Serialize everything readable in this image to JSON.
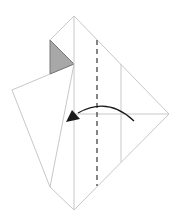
{
  "diagram": {
    "type": "origami-fold-step",
    "colors": {
      "background": "#ffffff",
      "paper_line": "#c8c8c8",
      "shaded_flap": "#a8a8a8",
      "shaded_outline": "#777777",
      "dashed_fold": "#444444",
      "arrow": "#1a1a1a"
    },
    "outer_diamond": {
      "top": [
        74,
        16
      ],
      "right": [
        169,
        114
      ],
      "bottom": [
        74,
        210
      ],
      "left_top_notch": [
        50,
        40
      ]
    },
    "center_vertical_crease": {
      "x": 74,
      "y1": 16,
      "y2": 210
    },
    "horizontal_crease": {
      "y": 114,
      "x1": 74,
      "x2": 169
    },
    "right_vertical_crease": {
      "x": 121,
      "y1": 64,
      "y2": 162
    },
    "valley_fold_dashed": {
      "x": 97,
      "y1": 40,
      "y2": 186
    },
    "shaded_triangle": [
      [
        50,
        40
      ],
      [
        74,
        64
      ],
      [
        50,
        74
      ]
    ],
    "left_flap": [
      [
        50,
        74
      ],
      [
        74,
        64
      ],
      [
        50,
        187
      ],
      [
        12,
        90
      ]
    ],
    "fold_arrow": {
      "start": [
        134,
        121
      ],
      "control": [
        100,
        95
      ],
      "end": [
        72,
        117
      ],
      "direction": "left"
    }
  }
}
